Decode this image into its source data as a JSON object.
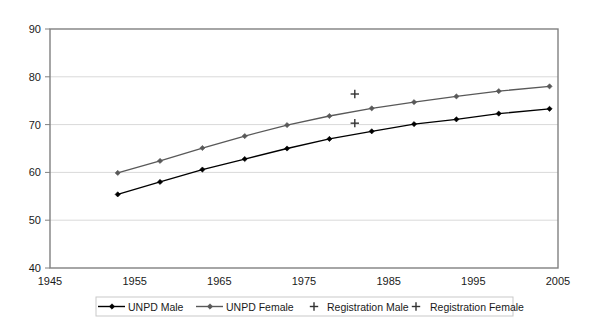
{
  "chart_data": {
    "type": "line",
    "title": "",
    "subtitle": "",
    "xlabel": "",
    "ylabel": "",
    "xlim": [
      1945,
      2005
    ],
    "ylim": [
      40,
      90
    ],
    "xticks": [
      1945,
      1955,
      1965,
      1975,
      1985,
      1995,
      2005
    ],
    "yticks": [
      40,
      50,
      60,
      70,
      80,
      90
    ],
    "xtick_labels": [
      "1945",
      "1955",
      "1965",
      "1975",
      "1985",
      "1995",
      "2005"
    ],
    "ytick_labels": [
      "40",
      "50",
      "60",
      "70",
      "80",
      "90"
    ],
    "grid": "horizontal",
    "legend_position": "bottom",
    "plot_bg": "#ffffff",
    "grid_color": "#d9d9d9",
    "axis_color": "#808080",
    "series": [
      {
        "name": "UNPD Male",
        "style": "line-marker",
        "color": "#000000",
        "marker": "diamond",
        "x": [
          1953,
          1958,
          1963,
          1968,
          1973,
          1978,
          1983,
          1988,
          1993,
          1998,
          2004
        ],
        "values": [
          55.4,
          58.0,
          60.6,
          62.8,
          65.0,
          67.0,
          68.6,
          70.1,
          71.1,
          72.3,
          73.3
        ]
      },
      {
        "name": "UNPD Female",
        "style": "line-marker",
        "color": "#595959",
        "marker": "diamond",
        "x": [
          1953,
          1958,
          1963,
          1968,
          1973,
          1978,
          1983,
          1988,
          1993,
          1998,
          2004
        ],
        "values": [
          59.9,
          62.4,
          65.1,
          67.6,
          69.9,
          71.8,
          73.4,
          74.7,
          75.9,
          77.0,
          78.0
        ]
      },
      {
        "name": "Registration Male",
        "style": "marker-only",
        "color": "#333333",
        "marker": "plus",
        "x": [
          1981
        ],
        "values": [
          70.3
        ]
      },
      {
        "name": "Registration Female",
        "style": "marker-only",
        "color": "#333333",
        "marker": "plus",
        "x": [
          1981
        ],
        "values": [
          76.4
        ]
      }
    ],
    "legend": [
      {
        "label": "UNPD Male",
        "marker": "line-diamond",
        "color": "#000000"
      },
      {
        "label": "UNPD Female",
        "marker": "line-diamond",
        "color": "#595959"
      },
      {
        "label": "Registration Male",
        "marker": "plus",
        "color": "#333333"
      },
      {
        "label": "Registration Female",
        "marker": "plus",
        "color": "#333333"
      }
    ]
  }
}
